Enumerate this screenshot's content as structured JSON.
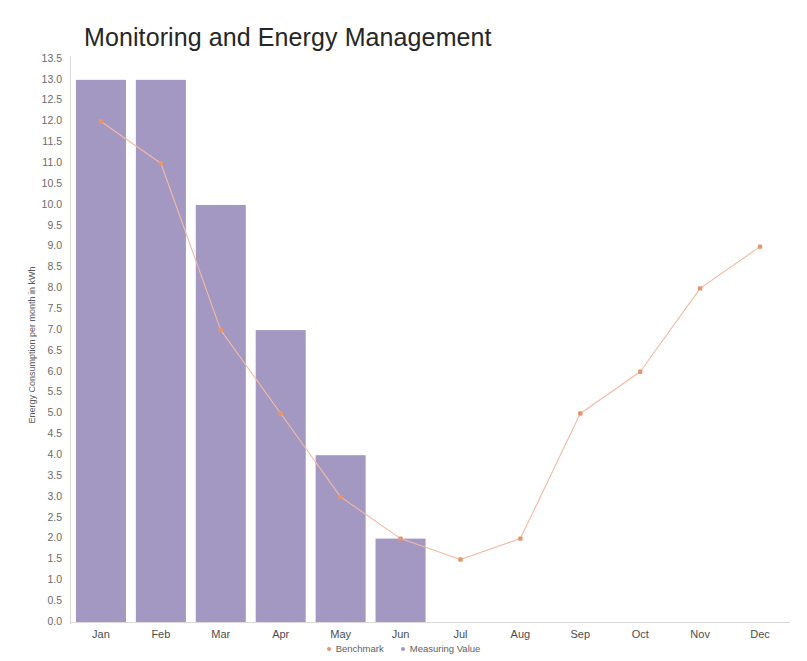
{
  "chart_data": {
    "type": "bar",
    "title": "Monitoring and Energy Management",
    "xlabel": "",
    "ylabel": "Energy Consumption per month in kWh",
    "categories": [
      "Jan",
      "Feb",
      "Mar",
      "Apr",
      "May",
      "Jun",
      "Jul",
      "Aug",
      "Sep",
      "Oct",
      "Nov",
      "Dec"
    ],
    "ylim": [
      0.0,
      13.5
    ],
    "ytick_step": 0.5,
    "yticks": [
      "13.5",
      "13.0",
      "12.5",
      "12.0",
      "11.5",
      "11.0",
      "10.5",
      "10.0",
      "9.5",
      "9.0",
      "8.5",
      "8.0",
      "7.5",
      "7.0",
      "6.5",
      "6.0",
      "5.5",
      "5.0",
      "4.5",
      "4.0",
      "3.5",
      "3.0",
      "2.5",
      "2.0",
      "1.5",
      "1.0",
      "0.5",
      "0.0"
    ],
    "grid": false,
    "legend_position": "bottom",
    "series": [
      {
        "name": "Measuring Value",
        "type": "bar",
        "color": "#a398c2",
        "values": [
          13.0,
          13.0,
          10.0,
          7.0,
          4.0,
          2.0,
          null,
          null,
          null,
          null,
          null,
          null
        ]
      },
      {
        "name": "Benchmark",
        "type": "line",
        "color": "#f3b9a3",
        "marker_color": "#e8956f",
        "values": [
          12.0,
          11.0,
          7.0,
          5.0,
          3.0,
          2.0,
          1.5,
          2.0,
          5.0,
          6.0,
          8.0,
          9.0
        ]
      }
    ]
  },
  "legend": {
    "items": [
      {
        "label": "Benchmark",
        "color": "#e8956f"
      },
      {
        "label": "Measuring Value",
        "color": "#a398c2"
      }
    ]
  }
}
